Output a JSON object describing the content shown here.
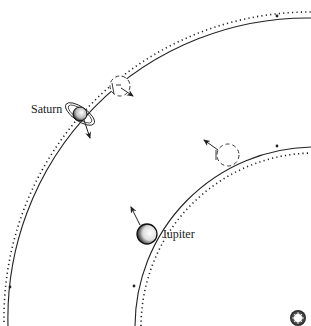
{
  "diagram": {
    "colors": {
      "line": "#222222",
      "background": "#ffffff",
      "sun": "#333333"
    },
    "labels": {
      "saturn": "Saturn",
      "jupiter": "Jupiter"
    },
    "bodies": [
      {
        "name": "Saturn",
        "type": "planet-ringed",
        "x": 80,
        "y": 114
      },
      {
        "name": "Saturn (ghost position)",
        "type": "ghost-dashed-circle",
        "x": 120,
        "y": 86
      },
      {
        "name": "Jupiter",
        "type": "planet",
        "x": 147,
        "y": 234
      },
      {
        "name": "Jupiter (ghost position)",
        "type": "ghost-dashed-circle",
        "x": 228,
        "y": 155
      },
      {
        "name": "Sun",
        "type": "star",
        "x": 298,
        "y": 318
      }
    ],
    "orbits": [
      {
        "name": "Saturn orbit",
        "style": "solid + dotted parallel"
      },
      {
        "name": "Jupiter orbit",
        "style": "solid + dotted parallel"
      }
    ]
  }
}
